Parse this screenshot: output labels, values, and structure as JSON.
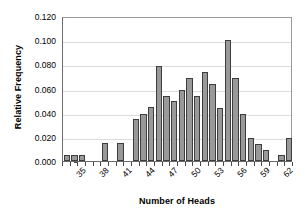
{
  "chart_data": {
    "type": "bar",
    "title": "",
    "xlabel": "Number of Heads",
    "ylabel": "Relative Frequency",
    "ylim": [
      0,
      0.12
    ],
    "ytick_labels": [
      "0.000",
      "0.020",
      "0.040",
      "0.060",
      "0.080",
      "0.100",
      "0.120"
    ],
    "ytick_values": [
      0.0,
      0.02,
      0.04,
      0.06,
      0.08,
      0.1,
      0.12
    ],
    "xtick_labels": [
      "35",
      "38",
      "41",
      "44",
      "47",
      "50",
      "53",
      "56",
      "59",
      "62"
    ],
    "xtick_values": [
      35,
      38,
      41,
      44,
      47,
      50,
      53,
      56,
      59,
      62
    ],
    "xlim": [
      34.5,
      64.5
    ],
    "grid": "horizontal",
    "legend": "none",
    "bar_color": "#999999",
    "bar_edge_color": "#3d3d3d",
    "grid_color": "#dcdcdc",
    "axis_color": "#6b6b6b",
    "categories": [
      35,
      36,
      37,
      38,
      39,
      40,
      41,
      42,
      43,
      44,
      45,
      46,
      47,
      48,
      49,
      50,
      51,
      52,
      53,
      54,
      55,
      56,
      57,
      58,
      59,
      60,
      61,
      62,
      63,
      64
    ],
    "values": [
      0.005,
      0.005,
      0.005,
      0.0,
      0.0,
      0.015,
      0.0,
      0.015,
      0.0,
      0.035,
      0.039,
      0.045,
      0.079,
      0.054,
      0.05,
      0.059,
      0.069,
      0.054,
      0.074,
      0.064,
      0.044,
      0.1,
      0.069,
      0.039,
      0.019,
      0.014,
      0.009,
      0.0,
      0.005,
      0.019
    ]
  }
}
